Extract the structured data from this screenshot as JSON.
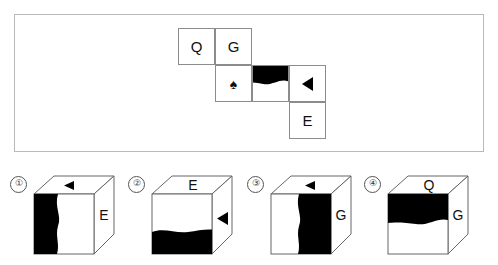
{
  "puzzle": {
    "type": "cube-net-folding",
    "net": {
      "grid_cols": 4,
      "grid_rows": 3,
      "cells": [
        {
          "id": "q",
          "row": 0,
          "col": 0,
          "content_type": "letter",
          "label": "Q"
        },
        {
          "id": "g",
          "row": 0,
          "col": 1,
          "content_type": "letter",
          "label": "G"
        },
        {
          "id": "spade",
          "row": 1,
          "col": 1,
          "content_type": "symbol",
          "label": "♠",
          "icon": "spade-icon"
        },
        {
          "id": "wave",
          "row": 1,
          "col": 2,
          "content_type": "pattern",
          "label": "",
          "icon": "black-wave-top-icon",
          "fill_position": "top",
          "fill_color": "#000000"
        },
        {
          "id": "tri",
          "row": 1,
          "col": 3,
          "content_type": "symbol",
          "label": "◀",
          "icon": "triangle-left-icon"
        },
        {
          "id": "e",
          "row": 2,
          "col": 3,
          "content_type": "letter",
          "label": "E"
        }
      ]
    },
    "options": [
      {
        "number": "①",
        "index": 1,
        "top_face": {
          "type": "symbol",
          "label": "◀",
          "icon": "triangle-left-icon"
        },
        "front_face": {
          "type": "pattern",
          "label": "",
          "icon": "black-wave-left-icon",
          "fill_position": "left",
          "fill_color": "#000000"
        },
        "right_face": {
          "type": "letter",
          "label": "E"
        }
      },
      {
        "number": "②",
        "index": 2,
        "top_face": {
          "type": "letter",
          "label": "E"
        },
        "front_face": {
          "type": "pattern",
          "label": "",
          "icon": "black-wave-bottom-icon",
          "fill_position": "bottom",
          "fill_color": "#000000"
        },
        "right_face": {
          "type": "symbol",
          "label": "◀",
          "icon": "triangle-left-icon"
        }
      },
      {
        "number": "③",
        "index": 3,
        "top_face": {
          "type": "symbol",
          "label": "◀",
          "icon": "triangle-left-icon"
        },
        "front_face": {
          "type": "pattern",
          "label": "",
          "icon": "black-wave-right-icon",
          "fill_position": "right",
          "fill_color": "#000000"
        },
        "right_face": {
          "type": "letter",
          "label": "G"
        }
      },
      {
        "number": "④",
        "index": 4,
        "top_face": {
          "type": "letter",
          "label": "Q"
        },
        "front_face": {
          "type": "pattern",
          "label": "",
          "icon": "black-wave-top-icon",
          "fill_position": "top",
          "fill_color": "#000000"
        },
        "right_face": {
          "type": "letter",
          "label": "G"
        }
      }
    ],
    "colors": {
      "fill": "#000000",
      "face": "#ffffff",
      "stroke": "#8c8c8c",
      "panel_border": "#b9b9b9",
      "number_ring": "#555555"
    }
  }
}
